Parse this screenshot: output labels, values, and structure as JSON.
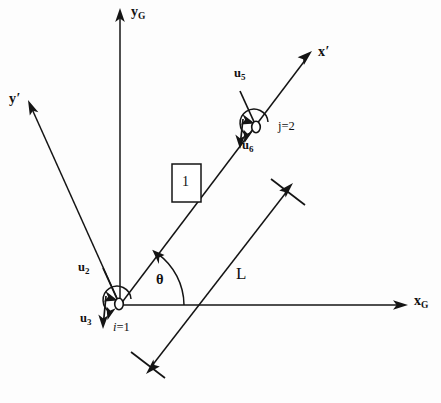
{
  "figure": {
    "type": "engineering-frame-diagram",
    "background_color": "#fdfdfd",
    "line_color": "#141414"
  },
  "axes": {
    "global_x": {
      "label": "x",
      "subscript": "G",
      "name": "xG"
    },
    "global_y": {
      "label": "y",
      "subscript": "G",
      "name": "yG"
    },
    "local_x": {
      "label": "x",
      "prime": "′",
      "name": "x-prime"
    },
    "local_y": {
      "label": "y",
      "prime": "′",
      "name": "y-prime"
    }
  },
  "angle": {
    "symbol": "θ",
    "between": "xG and x-prime"
  },
  "dimension": {
    "label": "L",
    "meaning": "element length"
  },
  "element": {
    "number": "1"
  },
  "nodes": [
    {
      "id": "i",
      "label_prefix": "i",
      "label_equals": "=1",
      "label": "i=1"
    },
    {
      "id": "j",
      "label_prefix": "j",
      "label_equals": "=2",
      "label": "j=2"
    }
  ],
  "dofs": [
    {
      "name": "u2",
      "base": "u",
      "sub": "2",
      "node": "i",
      "direction": "along y-prime, up-left"
    },
    {
      "name": "u3",
      "base": "u",
      "sub": "3",
      "node": "i",
      "direction": "down"
    },
    {
      "name": "u5",
      "base": "u",
      "sub": "5",
      "node": "j",
      "direction": "along y-prime, up-left"
    },
    {
      "name": "u6",
      "base": "u",
      "sub": "6",
      "node": "j",
      "direction": "down"
    }
  ]
}
